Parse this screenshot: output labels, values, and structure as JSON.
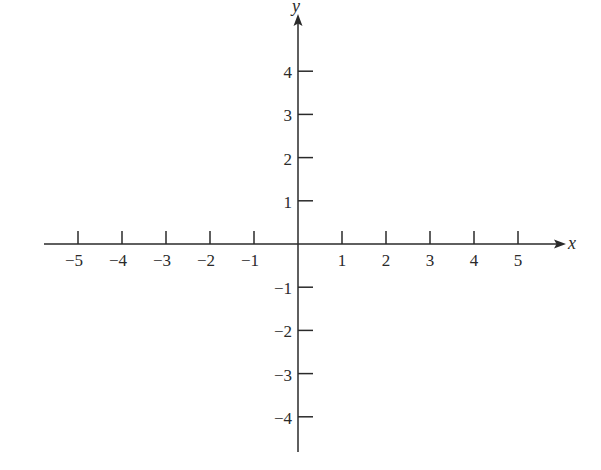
{
  "chart_data": {
    "type": "line",
    "title": "",
    "subtitle": "",
    "xlabel": "x",
    "ylabel": "y",
    "xlim": [
      -5,
      5
    ],
    "ylim": [
      -4,
      4
    ],
    "x_ticks": [
      -5,
      -4,
      -3,
      -2,
      -1,
      1,
      2,
      3,
      4,
      5
    ],
    "y_ticks": [
      4,
      3,
      2,
      1,
      -1,
      -2,
      -3,
      -4
    ],
    "x_tick_labels": [
      "−5",
      "−4",
      "−3",
      "−2",
      "−1",
      "1",
      "2",
      "3",
      "4",
      "5"
    ],
    "y_tick_labels": [
      "4",
      "3",
      "2",
      "1",
      "−1",
      "−2",
      "−3",
      "−4"
    ],
    "series": [],
    "grid": false,
    "legend": null,
    "arrows": {
      "x_axis": "positive end",
      "y_axis": "positive end"
    }
  },
  "colors": {
    "axis": "#2a2a2a",
    "background": "#ffffff"
  }
}
